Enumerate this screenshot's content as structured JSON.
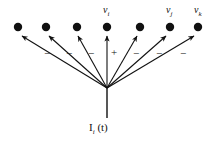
{
  "figure": {
    "background_color": "#ffffff",
    "ink_color": "#111111",
    "width": 219,
    "height": 142
  },
  "nodes": {
    "radius": 4.2,
    "row_y": 27,
    "items": [
      {
        "id": "node-1",
        "cx": 18,
        "cy": 27,
        "label": "",
        "label_sub": ""
      },
      {
        "id": "node-2",
        "cx": 46,
        "cy": 27,
        "label": "",
        "label_sub": ""
      },
      {
        "id": "node-3",
        "cx": 77,
        "cy": 27,
        "label": "",
        "label_sub": ""
      },
      {
        "id": "node-4",
        "cx": 107,
        "cy": 27,
        "label": "v",
        "label_sub": "i"
      },
      {
        "id": "node-5",
        "cx": 140,
        "cy": 27,
        "label": "",
        "label_sub": ""
      },
      {
        "id": "node-6",
        "cx": 170,
        "cy": 27,
        "label": "v",
        "label_sub": "j"
      },
      {
        "id": "node-7",
        "cx": 198,
        "cy": 27,
        "label": "v",
        "label_sub": "k"
      }
    ]
  },
  "labels": {
    "v_i": {
      "text": "v",
      "sub": "i",
      "x": 103,
      "y": 5
    },
    "v_j": {
      "text": "v",
      "sub": "j",
      "x": 166,
      "y": 5
    },
    "v_k": {
      "text": "v",
      "sub": "k",
      "x": 194,
      "y": 5
    }
  },
  "fan": {
    "origin_x": 107,
    "origin_y": 88,
    "arrows": [
      {
        "id": "arrow-1",
        "target_node": "node-1",
        "tip_x": 22,
        "tip_y": 36,
        "sign": "−",
        "sign_x": 44,
        "sign_y": 48
      },
      {
        "id": "arrow-2",
        "target_node": "node-2",
        "tip_x": 49,
        "tip_y": 36,
        "sign": "−",
        "sign_x": 66,
        "sign_y": 48
      },
      {
        "id": "arrow-3",
        "target_node": "node-3",
        "tip_x": 78,
        "tip_y": 36,
        "sign": "−",
        "sign_x": 88,
        "sign_y": 48
      },
      {
        "id": "arrow-4",
        "target_node": "node-4",
        "tip_x": 107,
        "tip_y": 36,
        "sign": "+",
        "sign_x": 111,
        "sign_y": 47
      },
      {
        "id": "arrow-5",
        "target_node": "node-5",
        "tip_x": 137,
        "tip_y": 36,
        "sign": "−",
        "sign_x": 133,
        "sign_y": 48
      },
      {
        "id": "arrow-6",
        "target_node": "node-6",
        "tip_x": 166,
        "tip_y": 36,
        "sign": "−",
        "sign_x": 156,
        "sign_y": 48
      },
      {
        "id": "arrow-7",
        "target_node": "node-7",
        "tip_x": 194,
        "tip_y": 36,
        "sign": "−",
        "sign_x": 180,
        "sign_y": 48
      }
    ]
  },
  "input": {
    "stem": {
      "x": 107,
      "y_top": 88,
      "y_bottom": 118
    },
    "label": {
      "prefix": "I",
      "sub": "i",
      "suffix": " (t)",
      "x": 89,
      "y": 122
    }
  }
}
